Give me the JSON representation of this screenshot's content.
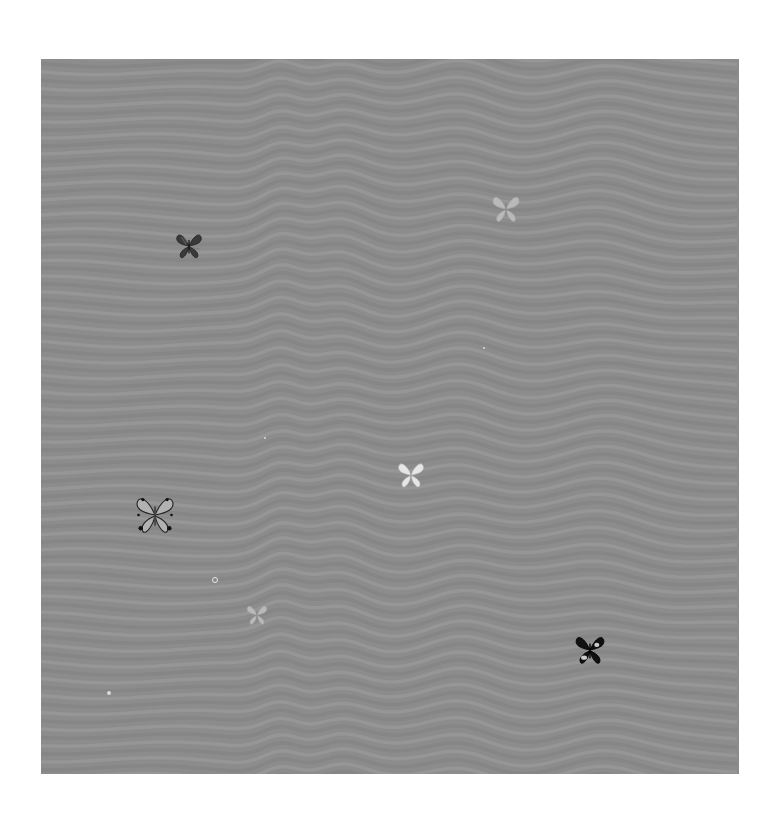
{
  "artwork": {
    "background_color": "#8c8c8c",
    "wave_light": "#9a9a9a",
    "wave_dark": "#838383",
    "page_color": "#ffffff"
  },
  "butterflies": [
    {
      "id": "dark-striped",
      "x": 189,
      "y": 246,
      "size": 30,
      "tone": "dark"
    },
    {
      "id": "pale-top-right",
      "x": 506,
      "y": 209,
      "size": 32,
      "tone": "pale"
    },
    {
      "id": "white-center",
      "x": 411,
      "y": 475,
      "size": 30,
      "tone": "white"
    },
    {
      "id": "spotted-left",
      "x": 155,
      "y": 515,
      "size": 44,
      "tone": "spotted"
    },
    {
      "id": "pale-small",
      "x": 257,
      "y": 615,
      "size": 24,
      "tone": "pale"
    },
    {
      "id": "black-bottom-right",
      "x": 590,
      "y": 650,
      "size": 34,
      "tone": "black"
    }
  ],
  "specks": [
    {
      "x": 215,
      "y": 580,
      "r": 3,
      "ring": true
    },
    {
      "x": 109,
      "y": 693,
      "r": 2,
      "ring": false
    },
    {
      "x": 265,
      "y": 438,
      "r": 1,
      "ring": false
    },
    {
      "x": 484,
      "y": 348,
      "r": 1,
      "ring": false
    }
  ]
}
